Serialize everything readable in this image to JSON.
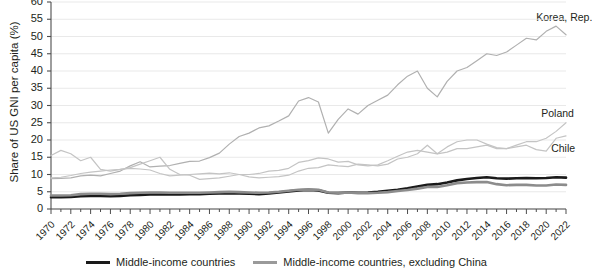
{
  "chart_data": {
    "type": "line",
    "title": "",
    "xlabel": "",
    "ylabel": "Share of US GNI per capita (%)",
    "ylim": [
      0,
      60
    ],
    "xlim": [
      1970,
      2022
    ],
    "yticks": [
      0,
      5,
      10,
      15,
      20,
      25,
      30,
      35,
      40,
      45,
      50,
      55,
      60
    ],
    "xticks": [
      1970,
      1972,
      1974,
      1976,
      1978,
      1980,
      1982,
      1984,
      1986,
      1988,
      1990,
      1992,
      1994,
      1996,
      1998,
      2000,
      2002,
      2004,
      2006,
      2008,
      2010,
      2012,
      2014,
      2016,
      2018,
      2020,
      2022
    ],
    "grid": "horizontal",
    "legend_position": "bottom",
    "x": [
      1970,
      1971,
      1972,
      1973,
      1974,
      1975,
      1976,
      1977,
      1978,
      1979,
      1980,
      1981,
      1982,
      1983,
      1984,
      1985,
      1986,
      1987,
      1988,
      1989,
      1990,
      1991,
      1992,
      1993,
      1994,
      1995,
      1996,
      1997,
      1998,
      1999,
      2000,
      2001,
      2002,
      2003,
      2004,
      2005,
      2006,
      2007,
      2008,
      2009,
      2010,
      2011,
      2012,
      2013,
      2014,
      2015,
      2016,
      2017,
      2018,
      2019,
      2020,
      2021,
      2022
    ],
    "series": [
      {
        "name": "Middle-income countries",
        "color": "#1a1a1a",
        "width": 2.6,
        "values": [
          3.4,
          3.4,
          3.5,
          3.7,
          3.8,
          3.8,
          3.7,
          3.8,
          4.0,
          4.1,
          4.2,
          4.2,
          4.2,
          4.2,
          4.3,
          4.3,
          4.4,
          4.5,
          4.6,
          4.5,
          4.4,
          4.3,
          4.5,
          4.8,
          5.1,
          5.4,
          5.5,
          5.4,
          4.7,
          4.6,
          4.8,
          4.7,
          4.8,
          5.0,
          5.3,
          5.6,
          6.0,
          6.5,
          7.0,
          7.2,
          7.7,
          8.3,
          8.7,
          9.0,
          9.2,
          8.9,
          8.8,
          8.9,
          9.0,
          8.9,
          9.0,
          9.2,
          9.1
        ]
      },
      {
        "name": "Middle-income countries, excluding China",
        "color": "#8c8c8c",
        "width": 2.6,
        "values": [
          3.9,
          3.9,
          4.0,
          4.3,
          4.4,
          4.4,
          4.3,
          4.4,
          4.6,
          4.7,
          4.8,
          4.8,
          4.7,
          4.7,
          4.7,
          4.7,
          4.8,
          4.9,
          5.0,
          4.9,
          4.8,
          4.7,
          4.8,
          5.0,
          5.3,
          5.6,
          5.7,
          5.6,
          4.8,
          4.7,
          4.8,
          4.6,
          4.6,
          4.7,
          4.9,
          5.2,
          5.5,
          5.9,
          6.4,
          6.4,
          6.9,
          7.5,
          7.7,
          7.8,
          7.8,
          7.2,
          6.9,
          7.0,
          7.0,
          6.8,
          6.8,
          7.1,
          7.0
        ]
      },
      {
        "name": "Korea, Rep.",
        "color": "#b0b0b0",
        "width": 1.2,
        "values": [
          8.8,
          8.9,
          9.0,
          9.6,
          9.8,
          9.6,
          10.3,
          11.0,
          12.5,
          13.7,
          12.2,
          12.4,
          12.6,
          13.2,
          13.8,
          13.9,
          14.9,
          16.2,
          18.8,
          21.0,
          22.0,
          23.5,
          24.1,
          25.5,
          27.0,
          31.3,
          32.3,
          31.0,
          22.0,
          26.0,
          29.0,
          27.5,
          30.0,
          31.5,
          33.0,
          36.0,
          38.5,
          40.0,
          35.0,
          32.5,
          37.0,
          40.0,
          41.0,
          43.0,
          45.0,
          44.5,
          45.5,
          47.5,
          49.5,
          49.0,
          51.5,
          53.0,
          50.5
        ]
      },
      {
        "name": "Chile",
        "color": "#c4c4c4",
        "width": 1.2,
        "values": [
          15.5,
          17.0,
          16.0,
          14.0,
          15.0,
          11.5,
          11.0,
          11.5,
          12.0,
          13.0,
          14.0,
          15.0,
          11.5,
          10.0,
          9.8,
          8.6,
          8.8,
          9.0,
          9.5,
          10.0,
          10.0,
          10.3,
          11.0,
          11.2,
          11.8,
          13.5,
          14.0,
          14.8,
          14.5,
          13.6,
          13.8,
          12.8,
          12.5,
          12.8,
          14.0,
          15.3,
          16.5,
          17.0,
          16.5,
          16.0,
          18.0,
          19.5,
          20.0,
          20.0,
          18.8,
          17.8,
          17.5,
          18.0,
          18.5,
          17.2,
          16.8,
          20.5,
          21.2
        ]
      },
      {
        "name": "Poland",
        "color": "#c4c4c4",
        "width": 1.2,
        "values": [
          9.0,
          9.2,
          9.7,
          10.3,
          10.7,
          11.0,
          11.3,
          11.5,
          11.8,
          11.6,
          11.3,
          10.3,
          9.6,
          9.8,
          10.0,
          10.2,
          10.4,
          10.2,
          10.5,
          10.0,
          9.3,
          9.0,
          9.2,
          9.4,
          9.8,
          11.0,
          11.8,
          12.0,
          12.8,
          12.5,
          12.3,
          13.0,
          12.8,
          12.5,
          13.0,
          14.5,
          15.0,
          16.0,
          18.5,
          16.0,
          16.5,
          17.5,
          17.5,
          18.0,
          18.5,
          17.5,
          17.5,
          18.5,
          19.5,
          19.5,
          20.5,
          22.5,
          25.0
        ]
      }
    ],
    "annotations": [
      {
        "text": "Korea, Rep.",
        "x": 2019.0,
        "y": 55.5
      },
      {
        "text": "Poland",
        "x": 2019.5,
        "y": 27.5
      },
      {
        "text": "Chile",
        "x": 2020.5,
        "y": 17.5
      }
    ]
  },
  "legend": {
    "items": [
      {
        "label": "Middle-income countries",
        "color": "#1a1a1a"
      },
      {
        "label": "Middle-income countries, excluding China",
        "color": "#9a9a9a"
      }
    ]
  }
}
